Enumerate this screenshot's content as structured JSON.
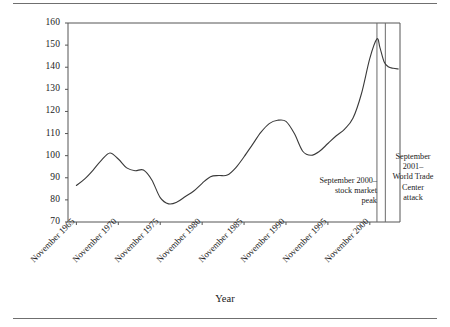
{
  "chart_data": {
    "type": "line",
    "title": "",
    "xlabel": "Year",
    "ylabel": "",
    "ylim": [
      70,
      160
    ],
    "yticks": [
      70,
      80,
      90,
      100,
      110,
      120,
      130,
      140,
      150,
      160
    ],
    "xlim": [
      "November 1964",
      "November 2003"
    ],
    "xticks": [
      "November 1965",
      "November 1970",
      "November 1975",
      "November 1980",
      "November 1985",
      "November 1990",
      "November 1995",
      "November 2000"
    ],
    "grid": false,
    "legend": null,
    "series": [
      {
        "name": "index",
        "x": [
          1965,
          1966,
          1967,
          1968,
          1969,
          1970,
          1971,
          1972,
          1973,
          1974,
          1975,
          1976,
          1977,
          1978,
          1979,
          1980,
          1981,
          1982,
          1983,
          1984,
          1985,
          1986,
          1987,
          1988,
          1989,
          1990,
          1991,
          1992,
          1993,
          1994,
          1995,
          1996,
          1997,
          1998,
          1999,
          2000,
          2000.85,
          2001.2,
          2001.7,
          2002.2,
          2002.8,
          2003.4
        ],
        "values": [
          86.5,
          89.5,
          93.5,
          98.0,
          101.2,
          98.5,
          94.5,
          93.2,
          93.5,
          89.0,
          81.0,
          78.2,
          79.0,
          81.5,
          84.0,
          87.5,
          90.5,
          91.0,
          91.2,
          94.5,
          99.5,
          105.0,
          110.5,
          114.5,
          116.0,
          115.5,
          110.0,
          102.0,
          100.2,
          102.0,
          105.5,
          109.0,
          112.0,
          117.0,
          128.0,
          144.0,
          152.8,
          149.0,
          142.5,
          140.2,
          139.5,
          139.2
        ]
      }
    ],
    "annotations": [
      {
        "id": "september-2000-stock-market-peak",
        "lines": [
          "September 2000–",
          "stock market",
          "peak"
        ],
        "marker_year": 2000.85,
        "align": "right"
      },
      {
        "id": "september-2001-world-trade-center-attack",
        "lines": [
          "September",
          "2001–",
          "World Trade",
          "Center",
          "attack"
        ],
        "marker_year": 2001.85,
        "align": "center"
      }
    ],
    "vertical_markers": [
      {
        "id": "marker-september-2000",
        "year": 2000.85
      },
      {
        "id": "marker-september-2001",
        "year": 2001.85
      }
    ],
    "colors": {
      "line": "#3a3a3a",
      "axis": "#555555",
      "marker": "#6a6a6a",
      "rule": "#6f6f6f",
      "text": "#1a1a1a",
      "background": "#ffffff"
    }
  }
}
